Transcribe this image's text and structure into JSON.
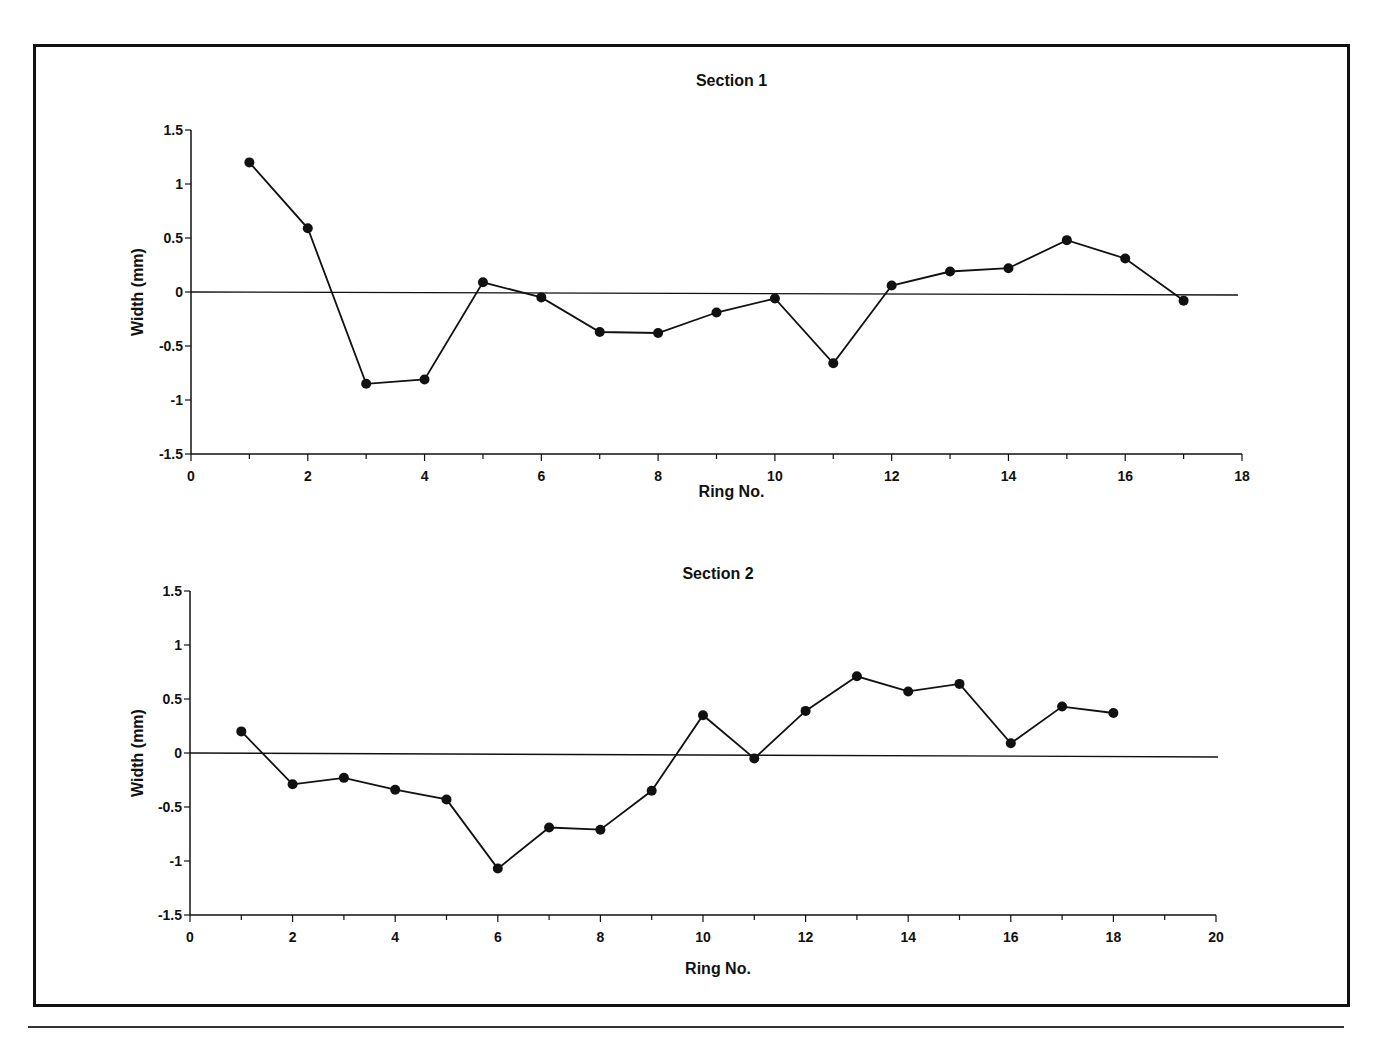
{
  "figure": {
    "frame_color": "#111111",
    "line_color": "#111111",
    "marker_color": "#111111"
  },
  "chart_data": [
    {
      "type": "line",
      "title": "Section 1",
      "xlabel": "Ring No.",
      "ylabel": "Width (mm)",
      "xlim": [
        0,
        18
      ],
      "ylim": [
        -1.5,
        1.5
      ],
      "xticks": [
        0,
        2,
        4,
        6,
        8,
        10,
        12,
        14,
        16,
        18
      ],
      "yticks": [
        1.5,
        1,
        0.5,
        0,
        -0.5,
        -1,
        -1.5
      ],
      "ytick_labels": [
        "1.5",
        "1",
        "0.5",
        "0",
        "-0.5",
        "-1",
        "-1.5"
      ],
      "grid": false,
      "zero_line": true,
      "legend": null,
      "series": [
        {
          "name": "Section 1",
          "x": [
            1,
            2,
            3,
            4,
            5,
            6,
            7,
            8,
            9,
            10,
            11,
            12,
            13,
            14,
            15,
            16,
            17
          ],
          "values": [
            1.2,
            0.59,
            -0.85,
            -0.81,
            0.09,
            -0.05,
            -0.37,
            -0.38,
            -0.19,
            -0.06,
            -0.66,
            0.06,
            0.19,
            0.22,
            0.48,
            0.31,
            -0.08
          ]
        }
      ]
    },
    {
      "type": "line",
      "title": "Section 2",
      "xlabel": "Ring No.",
      "ylabel": "Width (mm)",
      "xlim": [
        0,
        20
      ],
      "ylim": [
        -1.5,
        1.5
      ],
      "xticks": [
        0,
        2,
        4,
        6,
        8,
        10,
        12,
        14,
        16,
        18,
        20
      ],
      "yticks": [
        1.5,
        1,
        0.5,
        0,
        -0.5,
        -1,
        -1.5
      ],
      "ytick_labels": [
        "1.5",
        "1",
        "0.5",
        "0",
        "-0.5",
        "-1",
        "-1.5"
      ],
      "grid": false,
      "zero_line": true,
      "legend": null,
      "series": [
        {
          "name": "Section 2",
          "x": [
            1,
            2,
            3,
            4,
            5,
            6,
            7,
            8,
            9,
            10,
            11,
            12,
            13,
            14,
            15,
            16,
            17,
            18
          ],
          "values": [
            0.2,
            -0.29,
            -0.23,
            -0.34,
            -0.43,
            -1.07,
            -0.69,
            -0.71,
            -0.35,
            0.35,
            -0.05,
            0.39,
            0.71,
            0.57,
            0.64,
            0.09,
            0.43,
            0.37
          ]
        }
      ]
    }
  ]
}
